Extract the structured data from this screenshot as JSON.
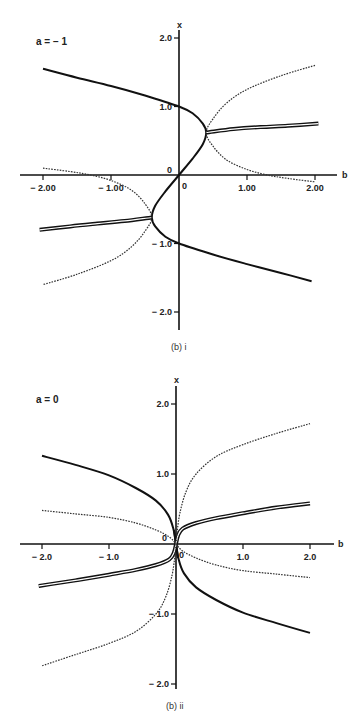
{
  "chart_data": [
    {
      "type": "line",
      "title": "a = −1",
      "caption": "(b) i",
      "xlabel": "b",
      "ylabel": "x",
      "xlim": [
        -2.3,
        2.3
      ],
      "ylim": [
        -2.2,
        2.2
      ],
      "grid": false,
      "x_ticks": [
        -2.0,
        -1.0,
        0,
        1.0,
        2.0
      ],
      "x_tick_labels": [
        "− 2.00",
        "− 1.00",
        "0",
        "1.00",
        "2.00"
      ],
      "y_ticks": [
        2.0,
        1.0,
        0,
        -1.0,
        -2.0
      ],
      "y_tick_labels": [
        "2.0",
        "1.0",
        "0",
        "− 1.0",
        "− 2.0"
      ],
      "series": [
        {
          "name": "solid",
          "style": "solid",
          "points": [
            [
              -2.0,
              1.55
            ],
            [
              -1.5,
              1.42
            ],
            [
              -1.0,
              1.3
            ],
            [
              -0.5,
              1.16
            ],
            [
              0.0,
              1.0
            ],
            [
              0.2,
              0.9
            ],
            [
              0.35,
              0.75
            ],
            [
              0.4,
              0.62
            ],
            [
              0.35,
              0.45
            ],
            [
              0.2,
              0.24
            ],
            [
              0.0,
              0.0
            ],
            [
              -0.2,
              -0.24
            ],
            [
              -0.35,
              -0.45
            ],
            [
              -0.4,
              -0.62
            ],
            [
              -0.35,
              -0.75
            ],
            [
              -0.2,
              -0.9
            ],
            [
              0.0,
              -1.0
            ],
            [
              0.5,
              -1.16
            ],
            [
              1.0,
              -1.3
            ],
            [
              1.5,
              -1.43
            ],
            [
              1.95,
              -1.55
            ]
          ]
        },
        {
          "name": "triple-right",
          "style": "triple",
          "points": [
            [
              0.4,
              0.62
            ],
            [
              0.8,
              0.67
            ],
            [
              1.2,
              0.7
            ],
            [
              1.6,
              0.72
            ],
            [
              2.05,
              0.75
            ]
          ]
        },
        {
          "name": "triple-left",
          "style": "triple",
          "points": [
            [
              -0.4,
              -0.62
            ],
            [
              -0.8,
              -0.67
            ],
            [
              -1.2,
              -0.71
            ],
            [
              -1.6,
              -0.75
            ],
            [
              -2.05,
              -0.8
            ]
          ]
        },
        {
          "name": "dotted-right",
          "style": "dotted",
          "points": [
            [
              2.0,
              1.6
            ],
            [
              1.5,
              1.45
            ],
            [
              1.0,
              1.25
            ],
            [
              0.7,
              1.05
            ],
            [
              0.5,
              0.82
            ],
            [
              0.4,
              0.62
            ],
            [
              0.5,
              0.42
            ],
            [
              0.7,
              0.22
            ],
            [
              1.0,
              0.08
            ],
            [
              1.3,
              0.0
            ],
            [
              1.6,
              -0.05
            ],
            [
              2.0,
              -0.1
            ]
          ]
        },
        {
          "name": "dotted-left",
          "style": "dotted",
          "points": [
            [
              -2.0,
              0.1
            ],
            [
              -1.6,
              0.05
            ],
            [
              -1.3,
              0.0
            ],
            [
              -1.0,
              -0.08
            ],
            [
              -0.7,
              -0.22
            ],
            [
              -0.5,
              -0.42
            ],
            [
              -0.4,
              -0.62
            ],
            [
              -0.5,
              -0.82
            ],
            [
              -0.7,
              -1.05
            ],
            [
              -1.0,
              -1.25
            ],
            [
              -1.5,
              -1.45
            ],
            [
              -2.0,
              -1.6
            ]
          ]
        }
      ]
    },
    {
      "type": "line",
      "title": "a = 0",
      "caption": "(b) ii",
      "xlabel": "b",
      "ylabel": "x",
      "xlim": [
        -2.3,
        2.3
      ],
      "ylim": [
        -2.1,
        2.3
      ],
      "grid": false,
      "x_ticks": [
        -2.0,
        -1.0,
        0,
        1.0,
        2.0
      ],
      "x_tick_labels": [
        "− 2.0",
        "− 1.0",
        "0",
        "1.0",
        "2.0"
      ],
      "y_ticks": [
        2.0,
        1.0,
        0,
        -1.0,
        -2.0
      ],
      "y_tick_labels": [
        "2.0",
        "1.0",
        "0",
        "− 1.0",
        "− 2.0"
      ],
      "series": [
        {
          "name": "solid-upper-left",
          "style": "solid",
          "points": [
            [
              -2.0,
              1.26
            ],
            [
              -1.5,
              1.13
            ],
            [
              -1.0,
              0.98
            ],
            [
              -0.6,
              0.8
            ],
            [
              -0.3,
              0.62
            ],
            [
              -0.12,
              0.42
            ],
            [
              -0.04,
              0.22
            ],
            [
              0.0,
              0.0
            ],
            [
              0.03,
              -0.2
            ]
          ]
        },
        {
          "name": "solid-lower-right",
          "style": "solid",
          "points": [
            [
              -0.03,
              0.2
            ],
            [
              0.0,
              0.0
            ],
            [
              0.04,
              -0.22
            ],
            [
              0.12,
              -0.42
            ],
            [
              0.3,
              -0.62
            ],
            [
              0.6,
              -0.8
            ],
            [
              1.0,
              -0.98
            ],
            [
              1.5,
              -1.13
            ],
            [
              2.0,
              -1.27
            ]
          ]
        },
        {
          "name": "triple-right",
          "style": "triple",
          "points": [
            [
              0.0,
              0.0
            ],
            [
              0.03,
              0.12
            ],
            [
              0.1,
              0.22
            ],
            [
              0.3,
              0.3
            ],
            [
              0.6,
              0.37
            ],
            [
              1.0,
              0.44
            ],
            [
              1.5,
              0.52
            ],
            [
              2.0,
              0.58
            ]
          ]
        },
        {
          "name": "triple-left",
          "style": "triple",
          "points": [
            [
              0.0,
              0.0
            ],
            [
              -0.03,
              -0.12
            ],
            [
              -0.1,
              -0.22
            ],
            [
              -0.3,
              -0.3
            ],
            [
              -0.6,
              -0.37
            ],
            [
              -1.0,
              -0.44
            ],
            [
              -1.5,
              -0.52
            ],
            [
              -2.05,
              -0.6
            ]
          ]
        },
        {
          "name": "dotted-upper",
          "style": "dotted",
          "points": [
            [
              0.0,
              0.0
            ],
            [
              0.02,
              0.2
            ],
            [
              0.06,
              0.45
            ],
            [
              0.15,
              0.75
            ],
            [
              0.3,
              1.0
            ],
            [
              0.6,
              1.25
            ],
            [
              1.0,
              1.42
            ],
            [
              1.5,
              1.58
            ],
            [
              2.0,
              1.72
            ]
          ]
        },
        {
          "name": "dotted-upper-left",
          "style": "dotted",
          "points": [
            [
              -2.0,
              0.48
            ],
            [
              -1.5,
              0.43
            ],
            [
              -1.0,
              0.38
            ],
            [
              -0.6,
              0.3
            ],
            [
              -0.3,
              0.2
            ],
            [
              -0.1,
              0.1
            ],
            [
              0.0,
              0.0
            ]
          ]
        },
        {
          "name": "dotted-lower-right",
          "style": "dotted",
          "points": [
            [
              0.0,
              0.0
            ],
            [
              0.1,
              -0.1
            ],
            [
              0.3,
              -0.2
            ],
            [
              0.6,
              -0.3
            ],
            [
              1.0,
              -0.38
            ],
            [
              1.5,
              -0.43
            ],
            [
              2.0,
              -0.48
            ]
          ]
        },
        {
          "name": "dotted-lower",
          "style": "dotted",
          "points": [
            [
              0.0,
              0.0
            ],
            [
              -0.02,
              -0.2
            ],
            [
              -0.06,
              -0.45
            ],
            [
              -0.15,
              -0.75
            ],
            [
              -0.3,
              -1.0
            ],
            [
              -0.6,
              -1.25
            ],
            [
              -1.0,
              -1.42
            ],
            [
              -1.5,
              -1.58
            ],
            [
              -2.0,
              -1.74
            ]
          ]
        }
      ]
    }
  ],
  "figure": {
    "panels": [
      {
        "param_label": "a = − 1",
        "caption": "(b) i",
        "x_axis_name": "b",
        "y_axis_name": "x",
        "origin_label": "0"
      },
      {
        "param_label": "a = 0",
        "caption": "(b) ii",
        "x_axis_name": "b",
        "y_axis_name": "x",
        "origin_label": "0"
      }
    ]
  }
}
